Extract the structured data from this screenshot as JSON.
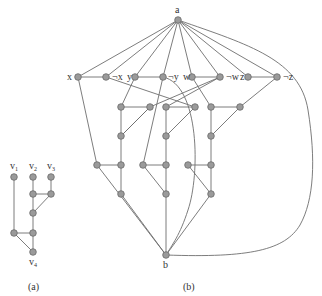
{
  "figure": {
    "caption_a": "(a)",
    "caption_b": "(b)"
  },
  "graph_a": {
    "labels": {
      "v1": "v",
      "v1_sub": "1",
      "v2": "v",
      "v2_sub": "2",
      "v3": "v",
      "v3_sub": "3",
      "v4": "v",
      "v4_sub": "4"
    }
  },
  "graph_b": {
    "labels": {
      "a": "a",
      "b": "b",
      "x": "x",
      "nx": "¬x",
      "y": "y",
      "ny": "¬y",
      "w": "w",
      "nw": "¬w",
      "z": "z",
      "nz": "¬z"
    }
  },
  "colors": {
    "node_fill": "#9a9a9a",
    "edge": "#6e6e6e",
    "text": "#333333"
  }
}
